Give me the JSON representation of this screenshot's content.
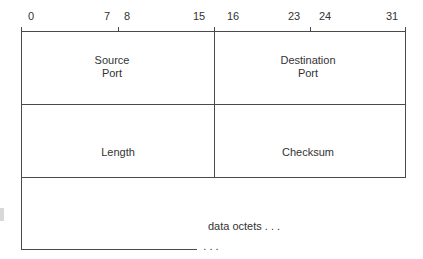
{
  "diagram": {
    "bit_labels": [
      "0",
      "7",
      "8",
      "15",
      "16",
      "23",
      "24",
      "31"
    ],
    "fields": {
      "source_port": "Source\nPort",
      "destination_port": "Destination\nPort",
      "length": "Length",
      "checksum": "Checksum",
      "data": "data octets . . .",
      "continuation": ". . ."
    },
    "line_color": "#4a4a4a",
    "text_color": "#333333"
  }
}
